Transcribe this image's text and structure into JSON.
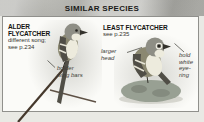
{
  "header": {
    "title": "SIMILAR SPECIES"
  },
  "species": {
    "alder": {
      "name_line1": "ALDER",
      "name_line2": "FLYCATCHER",
      "note_line1": "different song;",
      "note_line2": "see p.234"
    },
    "least": {
      "name": "LEAST FLYCATCHER",
      "note": "see p.235"
    }
  },
  "annotations": {
    "wing_bars": {
      "line1": "bolder",
      "line2": "wing bars"
    },
    "larger_head": {
      "line1": "larger",
      "line2": "head"
    },
    "eye_ring": {
      "line1": "bold",
      "line2": "white",
      "line3": "eye-",
      "line4": "ring"
    }
  },
  "colors": {
    "outer_bg": "#e9e9e4",
    "header_bg": "#bdbdb8",
    "header_text": "#1b1b19",
    "panel_bg": "#fbfbf8",
    "panel_border": "#90908c",
    "species_text": "#141412",
    "note_text": "#33332f",
    "annotation_text": "#3d3d39",
    "pointer_line": "#50504a",
    "bird_olive": "#8b8871",
    "bird_head": "#8e8e85",
    "bird_wing": "#504e46",
    "bird_underparts": "#edebdd",
    "wing_bar": "#e6e4d6",
    "branch": "#45382c",
    "twig": "#5d5044",
    "stump": "#98a093"
  }
}
